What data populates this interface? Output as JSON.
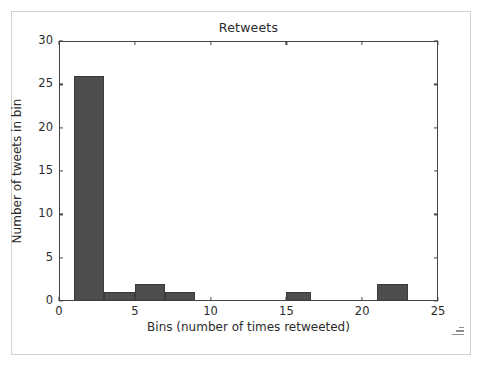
{
  "figure": {
    "title": "Retweets",
    "resize_grip": "resize-grip-icon",
    "background_color": "#ffffff",
    "frame_color": "#d2d2d2"
  },
  "chart_data": {
    "type": "bar",
    "title": "Retweets",
    "xlabel": "Bins (number of times retweeted)",
    "ylabel": "Number of tweets in bin",
    "xlim": [
      0,
      25
    ],
    "ylim": [
      0,
      30
    ],
    "grid": false,
    "legend": null,
    "bar_color": "#4d4d4d",
    "bar_edge_color": "#3a3a3a",
    "xticks": [
      0,
      5,
      10,
      15,
      20,
      25
    ],
    "xtick_labels": [
      "0",
      "5",
      "10",
      "15",
      "20",
      "25"
    ],
    "yticks": [
      0,
      5,
      10,
      15,
      20,
      25,
      30
    ],
    "ytick_labels": [
      "0",
      "5",
      "10",
      "15",
      "20",
      "25",
      "30"
    ],
    "bins": [
      {
        "start": 1,
        "end": 3,
        "value": 26
      },
      {
        "start": 3,
        "end": 5,
        "value": 1
      },
      {
        "start": 5,
        "end": 7,
        "value": 2
      },
      {
        "start": 7,
        "end": 9,
        "value": 1
      },
      {
        "start": 15,
        "end": 16.6,
        "value": 1
      },
      {
        "start": 21,
        "end": 23,
        "value": 2
      }
    ],
    "categories": [
      "1-3",
      "3-5",
      "5-7",
      "7-9",
      "15-16.6",
      "21-23"
    ],
    "values": [
      26,
      1,
      2,
      1,
      1,
      2
    ]
  }
}
